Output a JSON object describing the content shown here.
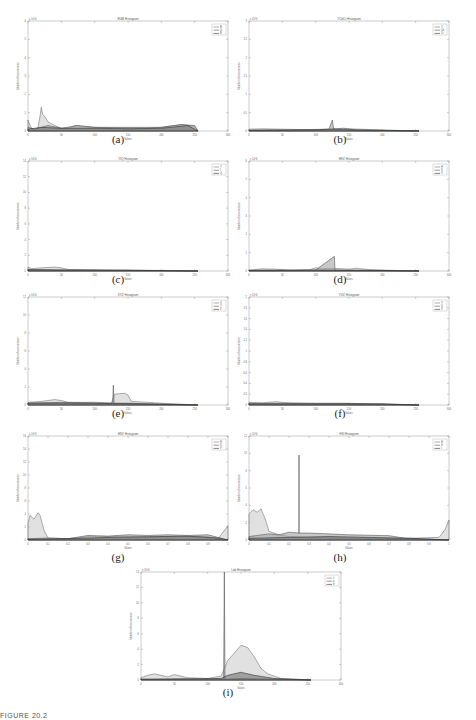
{
  "figure_footer": "FIGURE 20.2",
  "chart_data": [
    {
      "id": "a",
      "caption": "(a)",
      "type": "area",
      "title": "RGB Histogram",
      "xlabel": "Values",
      "ylabel": "Number of occurrences",
      "exponent": "x 10^4",
      "xlim": [
        0,
        300
      ],
      "xticks": [
        0,
        50,
        100,
        150,
        200,
        250,
        300
      ],
      "ylim": [
        0,
        6
      ],
      "yticks": [
        0,
        1,
        2,
        3,
        4,
        5,
        6
      ],
      "legend": [
        "R",
        "G",
        "B"
      ],
      "series": [
        {
          "name": "R",
          "x": [
            0,
            3,
            6,
            10,
            15,
            18,
            20,
            22,
            25,
            30,
            40,
            50,
            60,
            70,
            80,
            100,
            150,
            180,
            200,
            230,
            250,
            255
          ],
          "y": [
            0.6,
            0.3,
            0.1,
            0.05,
            0.2,
            0.8,
            1.3,
            0.9,
            0.8,
            0.5,
            0.3,
            0.15,
            0.12,
            0.3,
            0.25,
            0.2,
            0.15,
            0.15,
            0.2,
            0.35,
            0.25,
            0
          ]
        },
        {
          "name": "G",
          "x": [
            0,
            10,
            30,
            50,
            75,
            100,
            150,
            200,
            230,
            250,
            255
          ],
          "y": [
            0.2,
            0.1,
            0.3,
            0.15,
            0.3,
            0.2,
            0.2,
            0.2,
            0.35,
            0.3,
            0
          ]
        },
        {
          "name": "B",
          "x": [
            0,
            20,
            50,
            100,
            150,
            200,
            240,
            250,
            255
          ],
          "y": [
            0.1,
            0.2,
            0.15,
            0.15,
            0.12,
            0.15,
            0.3,
            0.1,
            0
          ]
        }
      ]
    },
    {
      "id": "b",
      "caption": "(b)",
      "type": "area",
      "title": "YCbCr Histogram",
      "xlabel": "Values",
      "ylabel": "Number of occurrences",
      "exponent": "x 10^5",
      "xlim": [
        0,
        300
      ],
      "xticks": [
        0,
        50,
        100,
        150,
        200,
        250,
        300
      ],
      "ylim": [
        0,
        3
      ],
      "yticks": [
        0,
        0.5,
        1,
        1.5,
        2,
        2.5,
        3
      ],
      "legend": [
        "Y",
        "Cb",
        "Cr"
      ],
      "series": [
        {
          "name": "Y",
          "x": [
            0,
            20,
            50,
            100,
            130,
            140,
            150,
            180,
            200,
            255
          ],
          "y": [
            0.05,
            0.06,
            0.05,
            0.03,
            0.04,
            0.08,
            0.06,
            0.04,
            0.03,
            0
          ]
        },
        {
          "name": "Cb",
          "x": [
            0,
            60,
            120,
            125,
            127,
            130,
            140,
            255
          ],
          "y": [
            0.02,
            0.03,
            0.05,
            0.3,
            0.05,
            0.05,
            0.03,
            0
          ]
        },
        {
          "name": "Cr",
          "x": [
            0,
            100,
            130,
            150,
            160,
            255
          ],
          "y": [
            0.02,
            0.03,
            0.06,
            0.05,
            0.03,
            0
          ]
        }
      ]
    },
    {
      "id": "c",
      "caption": "(c)",
      "type": "area",
      "title": "YIQ Histogram",
      "xlabel": "Values",
      "ylabel": "Number of occurrences",
      "exponent": "x 10^4",
      "xlim": [
        0,
        300
      ],
      "xticks": [
        0,
        50,
        100,
        150,
        200,
        250,
        300
      ],
      "ylim": [
        0,
        14
      ],
      "yticks": [
        0,
        2,
        4,
        6,
        8,
        10,
        12,
        14
      ],
      "legend": [
        "Y",
        "I",
        "Q"
      ],
      "series": [
        {
          "name": "Y",
          "x": [
            0,
            5,
            20,
            40,
            50,
            60,
            100,
            150,
            200,
            255
          ],
          "y": [
            0.5,
            0.3,
            0.4,
            0.5,
            0.4,
            0.2,
            0.15,
            0.1,
            0.08,
            0
          ]
        },
        {
          "name": "I",
          "x": [
            0,
            50,
            100,
            150,
            200,
            255
          ],
          "y": [
            0.2,
            0.15,
            0.1,
            0.1,
            0.05,
            0
          ]
        },
        {
          "name": "Q",
          "x": [
            0,
            50,
            100,
            150,
            200,
            255
          ],
          "y": [
            0.15,
            0.1,
            0.1,
            0.08,
            0.05,
            0
          ]
        }
      ]
    },
    {
      "id": "d",
      "caption": "(d)",
      "type": "area",
      "title": "HSV Histogram",
      "xlabel": "Values",
      "ylabel": "Number of occurrences",
      "exponent": "x 10^5",
      "xlim": [
        0,
        300
      ],
      "xticks": [
        0,
        50,
        100,
        150,
        200,
        250,
        300
      ],
      "ylim": [
        0,
        6
      ],
      "yticks": [
        0,
        1,
        2,
        3,
        4,
        5,
        6
      ],
      "legend": [
        "H",
        "S",
        "V"
      ],
      "series": [
        {
          "name": "H",
          "x": [
            0,
            20,
            40,
            60,
            90,
            100,
            110,
            130,
            150,
            160,
            180,
            200,
            255
          ],
          "y": [
            0.05,
            0.12,
            0.1,
            0.05,
            0.06,
            0.18,
            0.12,
            0.14,
            0.1,
            0.15,
            0.08,
            0.05,
            0
          ]
        },
        {
          "name": "S",
          "x": [
            0,
            50,
            100,
            128,
            129,
            130,
            150,
            255
          ],
          "y": [
            0.03,
            0.04,
            0.05,
            0.8,
            0.05,
            0.05,
            0.04,
            0
          ]
        },
        {
          "name": "V",
          "x": [
            0,
            100,
            200,
            255
          ],
          "y": [
            0.03,
            0.05,
            0.03,
            0
          ]
        }
      ]
    },
    {
      "id": "e",
      "caption": "(e)",
      "type": "area",
      "title": "XYZ Histogram",
      "xlabel": "Values",
      "ylabel": "Number of occurrences",
      "exponent": "x 10^4",
      "xlim": [
        0,
        300
      ],
      "xticks": [
        0,
        50,
        100,
        150,
        200,
        250,
        300
      ],
      "ylim": [
        0,
        12
      ],
      "yticks": [
        0,
        2,
        4,
        6,
        8,
        10,
        12
      ],
      "legend": [
        "X",
        "Y",
        "Z"
      ],
      "series": [
        {
          "name": "X",
          "x": [
            0,
            20,
            30,
            40,
            50,
            60,
            100,
            125,
            130,
            145,
            150,
            155,
            200,
            255
          ],
          "y": [
            0.3,
            0.4,
            0.5,
            0.6,
            0.5,
            0.3,
            0.3,
            0.2,
            1.2,
            1.3,
            1.1,
            0.4,
            0.2,
            0
          ]
        },
        {
          "name": "Y",
          "x": [
            0,
            50,
            100,
            127,
            128,
            129,
            150,
            255
          ],
          "y": [
            0.2,
            0.3,
            0.2,
            0.2,
            2.2,
            0.2,
            0.2,
            0
          ]
        },
        {
          "name": "Z",
          "x": [
            0,
            50,
            100,
            150,
            255
          ],
          "y": [
            0.2,
            0.2,
            0.2,
            0.15,
            0
          ]
        }
      ]
    },
    {
      "id": "f",
      "caption": "(f)",
      "type": "area",
      "title": "YUV Histogram",
      "xlabel": "Values",
      "ylabel": "Number of occurrences",
      "exponent": "x 10^4",
      "xlim": [
        0,
        300
      ],
      "xticks": [
        0,
        50,
        100,
        150,
        200,
        250,
        300
      ],
      "ylim": [
        0,
        2
      ],
      "yticks": [
        0,
        0.2,
        0.4,
        0.6,
        0.8,
        1,
        1.2,
        1.4,
        1.6,
        1.8,
        2
      ],
      "legend": [
        "Y",
        "U",
        "V"
      ],
      "series": [
        {
          "name": "Y",
          "x": [
            0,
            20,
            40,
            60,
            100,
            150,
            200,
            255
          ],
          "y": [
            0.05,
            0.04,
            0.06,
            0.04,
            0.03,
            0.03,
            0.02,
            0
          ]
        },
        {
          "name": "U",
          "x": [
            0,
            100,
            150,
            255
          ],
          "y": [
            0.03,
            0.03,
            0.03,
            0
          ]
        },
        {
          "name": "V",
          "x": [
            0,
            100,
            200,
            255
          ],
          "y": [
            0.02,
            0.02,
            0.02,
            0
          ]
        }
      ]
    },
    {
      "id": "g",
      "caption": "(g)",
      "type": "area",
      "title": "HSV Histogram",
      "xlabel": "Values",
      "ylabel": "Number of occurrences",
      "exponent": "x 10^4",
      "xlim": [
        0,
        1
      ],
      "xticks": [
        0,
        0.1,
        0.2,
        0.3,
        0.4,
        0.5,
        0.6,
        0.7,
        0.8,
        0.9,
        1
      ],
      "ylim": [
        0,
        16
      ],
      "yticks": [
        0,
        2,
        4,
        6,
        8,
        10,
        12,
        14,
        16
      ],
      "legend": [
        "H",
        "S",
        "V"
      ],
      "series": [
        {
          "name": "H",
          "x": [
            0,
            0.01,
            0.03,
            0.05,
            0.06,
            0.08,
            0.1,
            0.2,
            0.3,
            0.5,
            0.7,
            0.9,
            0.95,
            0.97,
            1
          ],
          "y": [
            2.5,
            3.8,
            3.2,
            4.2,
            3.8,
            1.5,
            0.3,
            0.2,
            0.5,
            0.5,
            0.5,
            0.5,
            0.2,
            1.0,
            2.2
          ]
        },
        {
          "name": "S",
          "x": [
            0,
            0.1,
            0.2,
            0.3,
            0.4,
            0.5,
            0.6,
            0.7,
            0.8,
            0.9,
            1
          ],
          "y": [
            0.2,
            0.3,
            0.2,
            0.7,
            0.6,
            0.8,
            0.7,
            0.8,
            0.7,
            0.8,
            0
          ]
        },
        {
          "name": "V",
          "x": [
            0,
            0.2,
            0.4,
            0.6,
            0.8,
            0.95,
            1
          ],
          "y": [
            0.1,
            0.2,
            0.4,
            0.5,
            0.6,
            0.3,
            0
          ]
        }
      ]
    },
    {
      "id": "h",
      "caption": "(h)",
      "type": "area",
      "title": "HSI Histogram",
      "xlabel": "Values",
      "ylabel": "Number of occurrences",
      "exponent": "x 10^4",
      "xlim": [
        0,
        1
      ],
      "xticks": [
        0,
        0.1,
        0.2,
        0.3,
        0.4,
        0.5,
        0.6,
        0.7,
        0.8,
        0.9,
        1
      ],
      "ylim": [
        0,
        12
      ],
      "yticks": [
        0,
        2,
        4,
        6,
        8,
        10,
        12
      ],
      "legend": [
        "H",
        "S",
        "I"
      ],
      "series": [
        {
          "name": "H",
          "x": [
            0,
            0.02,
            0.04,
            0.06,
            0.08,
            0.1,
            0.15,
            0.2,
            0.3,
            0.5,
            0.8,
            0.95,
            0.98,
            1
          ],
          "y": [
            3.0,
            3.5,
            3.2,
            3.6,
            2.5,
            1.0,
            0.6,
            0.4,
            0.3,
            0.2,
            0.2,
            0.3,
            1.2,
            2.3
          ]
        },
        {
          "name": "S",
          "x": [
            0,
            0.1,
            0.15,
            0.2,
            0.25,
            0.2499,
            0.25,
            0.2501,
            0.3,
            0.5,
            0.7,
            0.78,
            1
          ],
          "y": [
            0.4,
            0.7,
            0.6,
            0.9,
            0.8,
            0.8,
            9.8,
            0.8,
            0.8,
            0.6,
            0.5,
            0.2,
            0
          ]
        },
        {
          "name": "I",
          "x": [
            0,
            0.2,
            0.4,
            0.6,
            0.8,
            1
          ],
          "y": [
            0.2,
            0.3,
            0.4,
            0.3,
            0.2,
            0
          ]
        }
      ]
    },
    {
      "id": "i",
      "caption": "(i)",
      "type": "area",
      "title": "Lab Histogram",
      "xlabel": "Values",
      "ylabel": "Number of occurrences",
      "exponent": "x 10^4",
      "xlim": [
        0,
        300
      ],
      "xticks": [
        0,
        50,
        100,
        150,
        200,
        250,
        300
      ],
      "ylim": [
        0,
        14
      ],
      "yticks": [
        0,
        2,
        4,
        6,
        8,
        10,
        12,
        14
      ],
      "legend": [
        "L",
        "a",
        "b"
      ],
      "series": [
        {
          "name": "L",
          "x": [
            0,
            10,
            20,
            30,
            40,
            50,
            60,
            70,
            100,
            120,
            125,
            130,
            140,
            150,
            160,
            170,
            180,
            190,
            200,
            210,
            255
          ],
          "y": [
            0.3,
            0.6,
            0.8,
            0.6,
            0.4,
            0.7,
            0.5,
            0.3,
            0.2,
            0.5,
            1.5,
            2.5,
            3.5,
            4.5,
            4.2,
            3.0,
            1.5,
            0.8,
            0.5,
            0.2,
            0
          ]
        },
        {
          "name": "a",
          "x": [
            0,
            100,
            124,
            125,
            126,
            150,
            255
          ],
          "y": [
            0.1,
            0.1,
            0.1,
            14,
            0.1,
            0.2,
            0
          ]
        },
        {
          "name": "b",
          "x": [
            0,
            120,
            130,
            150,
            170,
            200,
            255
          ],
          "y": [
            0.1,
            0.2,
            0.6,
            1.0,
            0.6,
            0.2,
            0
          ]
        }
      ]
    }
  ]
}
